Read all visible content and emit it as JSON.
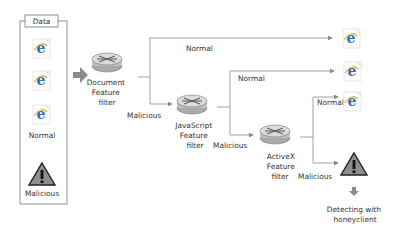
{
  "data_box": {
    "title": "Data",
    "normal_label": "Normal",
    "malicious_label": "Malicious"
  },
  "filters": [
    {
      "name": "document",
      "lines": [
        "Document",
        "Feature",
        "filter"
      ]
    },
    {
      "name": "javascript",
      "lines": [
        "JavaScript",
        "Feature",
        "filter"
      ]
    },
    {
      "name": "activex",
      "lines": [
        "ActiveX",
        "Feature",
        "filter"
      ]
    }
  ],
  "edges": {
    "doc_normal": "Normal",
    "doc_malicious": "Malicious",
    "js_normal": "Normal",
    "js_malicious": "Malicious",
    "ax_normal": "Normal",
    "ax_malicious": "Malicious"
  },
  "output": {
    "detect_lines": [
      "Detecting with",
      "honeyclient"
    ]
  },
  "colors": {
    "line": "#8a8a8a",
    "arrow": "#8c8c8c",
    "ie_blue": "#2f6fc0",
    "ie_ring": "#e8b43a",
    "warn_fill": "#8e8e8e",
    "router_body": "#c9c9c9"
  }
}
